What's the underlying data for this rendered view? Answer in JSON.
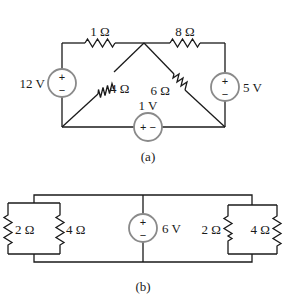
{
  "figure_a": {
    "caption": "(a)",
    "resistors": {
      "top_left": "1 Ω",
      "top_right": "8 Ω",
      "diag_left": "4 Ω",
      "diag_right": "6 Ω"
    },
    "sources": {
      "left": {
        "label": "12 V",
        "plus": "+",
        "minus": "−"
      },
      "right": {
        "label": "5 V",
        "plus": "+",
        "minus": "−"
      },
      "bottom": {
        "label": "1 V",
        "signs": "+ −"
      }
    }
  },
  "figure_b": {
    "caption": "(b)",
    "resistors": {
      "left_a": "2 Ω",
      "left_b": "4 Ω",
      "right_a": "2 Ω",
      "right_b": "4 Ω"
    },
    "sources": {
      "center": {
        "label": "6 V",
        "plus": "+",
        "minus": "−"
      }
    }
  }
}
